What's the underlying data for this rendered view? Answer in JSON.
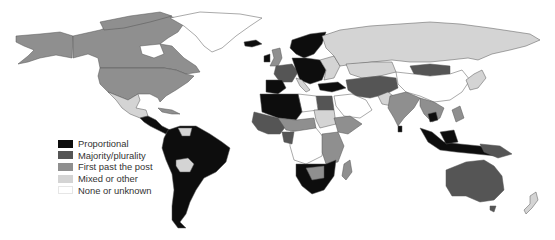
{
  "map": {
    "type": "world choropleth",
    "subject": "Electoral systems by country",
    "colors": {
      "proportional": "#0d0d0d",
      "majority_plurality": "#555555",
      "first_past_the_post": "#8f8f8f",
      "mixed_or_other": "#d4d4d4",
      "none_or_unknown": "#ffffff"
    },
    "regions": [
      {
        "name": "Canada",
        "category": "first_past_the_post"
      },
      {
        "name": "United States",
        "category": "first_past_the_post"
      },
      {
        "name": "Alaska",
        "category": "first_past_the_post"
      },
      {
        "name": "Greenland",
        "category": "none_or_unknown"
      },
      {
        "name": "Mexico",
        "category": "mixed_or_other"
      },
      {
        "name": "Central America",
        "category": "proportional"
      },
      {
        "name": "South America",
        "category": "proportional"
      },
      {
        "name": "Bolivia",
        "category": "mixed_or_other"
      },
      {
        "name": "Venezuela",
        "category": "mixed_or_other"
      },
      {
        "name": "Iceland",
        "category": "proportional"
      },
      {
        "name": "Scandinavia",
        "category": "proportional"
      },
      {
        "name": "United Kingdom",
        "category": "first_past_the_post"
      },
      {
        "name": "France",
        "category": "majority_plurality"
      },
      {
        "name": "Iberia",
        "category": "proportional"
      },
      {
        "name": "Central Europe",
        "category": "proportional"
      },
      {
        "name": "Russia",
        "category": "mixed_or_other"
      },
      {
        "name": "Kazakhstan",
        "category": "mixed_or_other"
      },
      {
        "name": "Mongolia",
        "category": "majority_plurality"
      },
      {
        "name": "China",
        "category": "none_or_unknown"
      },
      {
        "name": "Central Asia / Iran",
        "category": "majority_plurality"
      },
      {
        "name": "India",
        "category": "first_past_the_post"
      },
      {
        "name": "Saudi Arabia",
        "category": "none_or_unknown"
      },
      {
        "name": "Egypt",
        "category": "majority_plurality"
      },
      {
        "name": "Libya",
        "category": "none_or_unknown"
      },
      {
        "name": "Algeria",
        "category": "proportional"
      },
      {
        "name": "West Africa",
        "category": "majority_plurality"
      },
      {
        "name": "Central Africa",
        "category": "none_or_unknown"
      },
      {
        "name": "East Africa",
        "category": "first_past_the_post"
      },
      {
        "name": "Southern Africa",
        "category": "proportional"
      },
      {
        "name": "Madagascar",
        "category": "first_past_the_post"
      },
      {
        "name": "Indonesia",
        "category": "proportional"
      },
      {
        "name": "Southeast Asia",
        "category": "first_past_the_post"
      },
      {
        "name": "Australia",
        "category": "majority_plurality"
      },
      {
        "name": "New Zealand",
        "category": "mixed_or_other"
      },
      {
        "name": "Japan",
        "category": "mixed_or_other"
      }
    ]
  },
  "legend": {
    "items": [
      {
        "key": "proportional",
        "label": "Proportional",
        "color": "#0d0d0d"
      },
      {
        "key": "majority_plurality",
        "label": "Majority/plurality",
        "color": "#555555"
      },
      {
        "key": "first_past_the_post",
        "label": "First past the post",
        "color": "#8f8f8f"
      },
      {
        "key": "mixed_or_other",
        "label": "Mixed or other",
        "color": "#d4d4d4"
      },
      {
        "key": "none_or_unknown",
        "label": "None or unknown",
        "color": "#ffffff"
      }
    ]
  }
}
